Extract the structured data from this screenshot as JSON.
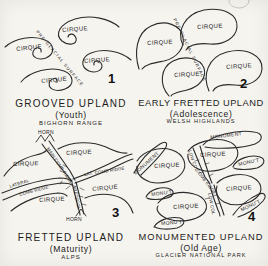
{
  "panels": {
    "p1": {
      "number": "1",
      "caption": {
        "title": "GROOVED UPLAND",
        "stage": "(Youth)",
        "location": "BIGHORN RANGE"
      },
      "labels": {
        "cirque": "CIRQUE",
        "surface": "PRE-GLACIAL SURFACE"
      }
    },
    "p2": {
      "number": "2",
      "caption": {
        "title": "EARLY FRETTED UPLAND",
        "stage": "(Adolescence)",
        "location": "WELSH HIGHLANDS"
      },
      "labels": {
        "cirque": "CIRQUE",
        "surface": "PRE-GLACIAL SURFACE"
      }
    },
    "p3": {
      "number": "3",
      "caption": {
        "title": "FRETTED UPLAND",
        "stage": "(Maturity)",
        "location": "ALPS"
      },
      "labels": {
        "cirque": "CIRQUE",
        "horn": "HORN",
        "col": "COL",
        "arete": "ARÊTE",
        "main_ridge": "MAIN COMB RIDGE",
        "lateral_line1": "LATERAL",
        "lateral_line2": "COMB RIDGE",
        "lat_ridge": "LAT. COMB RIDGE"
      }
    },
    "p4": {
      "number": "4",
      "caption": {
        "title": "MONUMENTED UPLAND",
        "stage": "(Old Age)",
        "location": "GLACIER NATIONAL PARK"
      },
      "labels": {
        "cirque": "CIRQUE",
        "monument": "MONUMENT",
        "monut": "MONU'T",
        "low_col": "LOW COL",
        "comb_ridge": "COMB RIDGE"
      }
    }
  },
  "ink_color": "#2b2b2b",
  "paper_color": "#f6f4ef"
}
